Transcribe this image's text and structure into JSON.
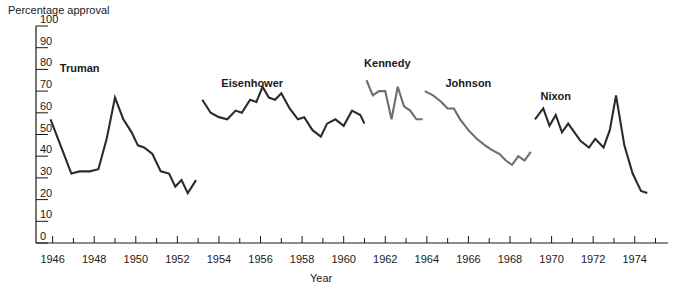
{
  "chart_data": {
    "type": "line",
    "title": "Percentage approval",
    "xlabel": "Year",
    "ylabel": "Percentage approval",
    "xlim": [
      1945.2,
      1975.6
    ],
    "ylim": [
      0,
      100
    ],
    "grid": false,
    "legend_position": "inline-annotations",
    "y_ticks": [
      0,
      10,
      20,
      30,
      40,
      50,
      60,
      70,
      80,
      90,
      100
    ],
    "y_tick_labels": [
      "0",
      "10",
      "20",
      "30",
      "40",
      "50",
      "60",
      "70",
      "80",
      "90",
      "100"
    ],
    "x_ticks_major": [
      1946,
      1948,
      1950,
      1952,
      1954,
      1956,
      1958,
      1960,
      1962,
      1964,
      1966,
      1968,
      1970,
      1972,
      1974
    ],
    "x_tick_labels": [
      "1946",
      "1948",
      "1950",
      "1952",
      "1954",
      "1956",
      "1958",
      "1960",
      "1962",
      "1964",
      "1966",
      "1968",
      "1970",
      "1972",
      "1974"
    ],
    "x_ticks_minor": [
      1945,
      1947,
      1949,
      1951,
      1953,
      1955,
      1957,
      1959,
      1961,
      1963,
      1965,
      1967,
      1969,
      1971,
      1973,
      1975
    ],
    "colors": {
      "dark": "#2b2b2b",
      "gray": "#6e6e6e",
      "axis": "#1a1a1a"
    },
    "series": [
      {
        "name": "Truman",
        "color": "#2b2b2b",
        "label_x": 1947.3,
        "label_y": 79,
        "x": [
          1945.9,
          1946.5,
          1946.9,
          1947.3,
          1947.8,
          1948.2,
          1948.6,
          1949.0,
          1949.4,
          1949.8,
          1950.1,
          1950.4,
          1950.8,
          1951.2,
          1951.6,
          1951.9,
          1952.2,
          1952.5,
          1952.9
        ],
        "y": [
          57,
          42,
          32,
          33,
          33,
          34,
          48,
          67,
          57,
          51,
          45,
          44,
          41,
          33,
          32,
          26,
          29,
          23,
          29
        ]
      },
      {
        "name": "Eisenhower",
        "color": "#2b2b2b",
        "label_x": 1955.6,
        "label_y": 72,
        "x": [
          1953.2,
          1953.6,
          1954.0,
          1954.4,
          1954.8,
          1955.1,
          1955.5,
          1955.8,
          1956.1,
          1956.4,
          1956.7,
          1957.0,
          1957.4,
          1957.8,
          1958.1,
          1958.5,
          1958.9,
          1959.2,
          1959.6,
          1960.0,
          1960.4,
          1960.8,
          1961.0
        ],
        "y": [
          66,
          60,
          58,
          57,
          61,
          60,
          66,
          65,
          72,
          67,
          66,
          69,
          62,
          57,
          58,
          52,
          49,
          55,
          57,
          54,
          61,
          59,
          55
        ]
      },
      {
        "name": "Kennedy",
        "color": "#6e6e6e",
        "label_x": 1962.1,
        "label_y": 81,
        "x": [
          1961.1,
          1961.4,
          1961.7,
          1962.0,
          1962.3,
          1962.6,
          1962.9,
          1963.2,
          1963.5,
          1963.8
        ],
        "y": [
          75,
          68,
          70,
          70,
          57,
          72,
          63,
          61,
          57,
          57
        ]
      },
      {
        "name": "Johnson",
        "color": "#6e6e6e",
        "label_x": 1966.0,
        "label_y": 72,
        "x": [
          1963.9,
          1964.3,
          1964.7,
          1965.0,
          1965.3,
          1965.6,
          1966.0,
          1966.4,
          1966.8,
          1967.1,
          1967.5,
          1967.8,
          1968.1,
          1968.4,
          1968.7,
          1969.0
        ],
        "y": [
          70,
          68,
          65,
          62,
          62,
          57,
          52,
          48,
          45,
          43,
          41,
          38,
          36,
          40,
          38,
          42
        ]
      },
      {
        "name": "Nixon",
        "color": "#2b2b2b",
        "label_x": 1970.2,
        "label_y": 66,
        "x": [
          1969.2,
          1969.6,
          1969.9,
          1970.2,
          1970.5,
          1970.8,
          1971.1,
          1971.4,
          1971.8,
          1972.1,
          1972.5,
          1972.8,
          1973.1,
          1973.5,
          1973.9,
          1974.3,
          1974.6
        ],
        "y": [
          57,
          62,
          54,
          59,
          51,
          55,
          51,
          47,
          44,
          48,
          44,
          52,
          68,
          45,
          32,
          24,
          23
        ]
      }
    ]
  }
}
